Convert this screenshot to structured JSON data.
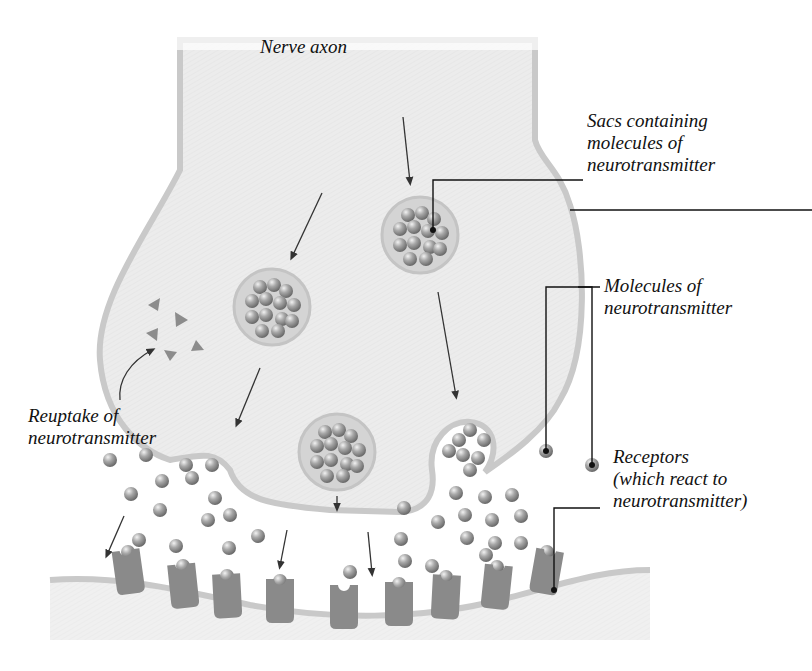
{
  "diagram": {
    "colors": {
      "axon_fill": "#ececec",
      "membrane": "#c9c9c9",
      "sac_fill": "#d4d4d4",
      "molecule": "#9a9a9a",
      "receptor": "#8a8a8a",
      "triangle": "#8c8c8c",
      "leader_line": "#111111",
      "label_text": "#111111"
    },
    "labels": {
      "nerve_axon": "Nerve axon",
      "sacs": "Sacs containing\nmolecules of\nneurotransmitter",
      "molecules": "Molecules of\nneurotransmitter",
      "receptors": "Receptors\n(which react to\nneurotransmitter)",
      "reuptake": "Reuptake of\nneurotransmitter"
    }
  }
}
